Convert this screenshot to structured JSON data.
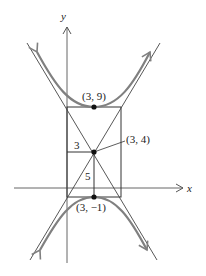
{
  "diagram": {
    "type": "hyperbola",
    "axes": {
      "x_label": "x",
      "y_label": "y"
    },
    "points": [
      {
        "id": "upper-vertex",
        "label": "(3, 9)"
      },
      {
        "id": "center",
        "label": "(3, 4)"
      },
      {
        "id": "lower-vertex",
        "label": "(3, −1)"
      }
    ],
    "dimensions": {
      "horizontal": "3",
      "vertical": "5"
    },
    "colors": {
      "curve": "#808080",
      "lines": "#333333",
      "axes": "#555555"
    }
  }
}
